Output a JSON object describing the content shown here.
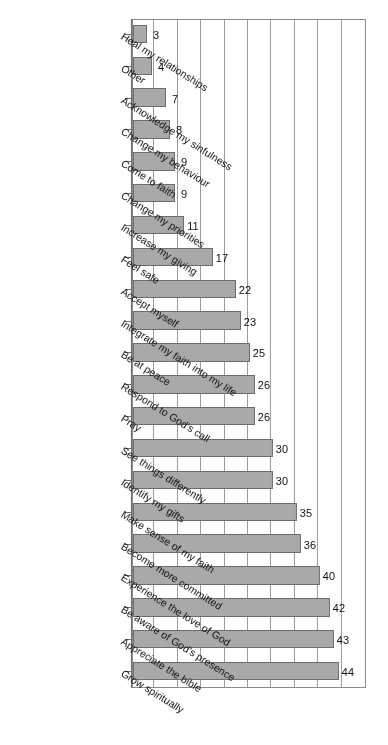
{
  "chart_data": {
    "type": "bar",
    "orientation": "horizontal",
    "title": "",
    "subtitle": "",
    "xlabel": "",
    "ylabel": "",
    "xlim": [
      0,
      50
    ],
    "grid": true,
    "gridlines": [
      0,
      5,
      10,
      15,
      20,
      25,
      30,
      35,
      40,
      45,
      50
    ],
    "legend": "none",
    "bar_color": "#a9a9a9",
    "bar_border_color": "#6d6d6d",
    "axis_color": "#6d6d6d",
    "grid_color": "#9b9b9b",
    "background": "#ffffff",
    "rotation_note": "figure rendered upside-down (180 degrees)",
    "categories": [
      "Grow spiritually",
      "Appreciate the bible",
      "Be aware of God's presence",
      "Experience the love of God",
      "Become more committed",
      "Make sense of my faith",
      "Identify my gifts",
      "See things differently",
      "Pray",
      "Respond to God's call",
      "Be at peace",
      "Integrate my faith into my life",
      "Accept myself",
      "Feel safe",
      "Increase my giving",
      "Change my priorities",
      "Come to faith",
      "Change my behaviour",
      "Acknowledge my sinfulness",
      "Other",
      "Heal my relationships"
    ],
    "values": [
      44,
      43,
      42,
      40,
      36,
      35,
      30,
      30,
      26,
      26,
      25,
      23,
      22,
      17,
      11,
      9,
      9,
      8,
      7,
      4,
      3
    ],
    "value_labels": [
      "44",
      "43",
      "42",
      "40",
      "36",
      "35",
      "30",
      "30",
      "26",
      "26",
      "25",
      "23",
      "22",
      "17",
      "11",
      "9",
      "9",
      "8",
      "7",
      "4",
      "3"
    ]
  }
}
